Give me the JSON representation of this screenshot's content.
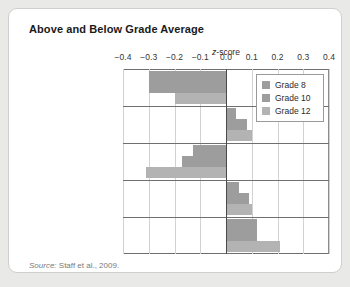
{
  "card": {
    "title": "Above and Below Grade Average",
    "source_prefix": "Source:",
    "source_text": " Staff et al., 2009."
  },
  "chart_data": {
    "type": "bar",
    "orientation": "horizontal",
    "title": "Above and Below Grade Average",
    "xlabel": "z-score",
    "ylabel": "",
    "xlim": [
      -0.4,
      0.4
    ],
    "xticks": [
      -0.4,
      -0.3,
      -0.2,
      -0.1,
      0.0,
      0.1,
      0.2,
      0.3,
      0.4
    ],
    "xticklabels": [
      "−0.4",
      "−0.3",
      "−0.2",
      "−0.1",
      "0.0",
      "0.1",
      "0.2",
      "0.3",
      "0.4"
    ],
    "grid": true,
    "legend_position": "upper right",
    "zero_reference_line": 0.0,
    "categories": [
      "Work over 20 hr/wk",
      "Work 20 or fewer hr/wk",
      "Not employed but wish for >20 hr/wk",
      "Not employed but wish for <20 hr/wk",
      "Not employed and don't want to work"
    ],
    "category_lines": [
      [
        "Work over",
        "20 hr/wk"
      ],
      [
        "Work 20 or",
        "fewer hr/wk"
      ],
      [
        "Not employed but",
        "wish for >20 hr/wk"
      ],
      [
        "Not employed but",
        "wish for <20 hr/wk"
      ],
      [
        "Not employed and",
        "don't want to work"
      ]
    ],
    "series": [
      {
        "name": "Grade 8",
        "color": "#9d9d9d",
        "values": [
          -0.3,
          0.04,
          -0.13,
          0.05,
          0.12
        ]
      },
      {
        "name": "Grade 10",
        "color": "#9d9d9d",
        "values": [
          -0.3,
          0.08,
          -0.17,
          0.09,
          0.12
        ]
      },
      {
        "name": "Grade 12",
        "color": "#b3b3b3",
        "values": [
          -0.2,
          0.1,
          -0.31,
          0.1,
          0.21
        ]
      }
    ]
  },
  "legend": {
    "items": [
      {
        "label": "Grade 8",
        "color": "#9d9d9d"
      },
      {
        "label": "Grade 10",
        "color": "#9d9d9d"
      },
      {
        "label": "Grade 12",
        "color": "#b3b3b3"
      }
    ]
  }
}
